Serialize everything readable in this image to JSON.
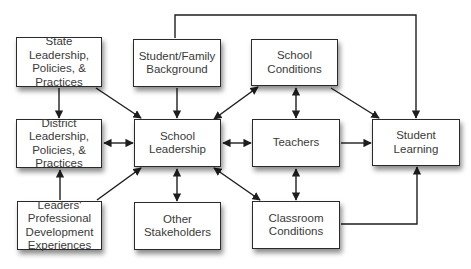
{
  "diagram": {
    "type": "flowchart",
    "title": "",
    "nodes": [
      {
        "id": "state",
        "label": "State\nLeadership,\nPolicies, &\nPractices",
        "x": 16,
        "y": 37,
        "w": 86,
        "h": 50
      },
      {
        "id": "family",
        "label": "Student/Family\nBackground",
        "x": 133,
        "y": 39,
        "w": 88,
        "h": 48
      },
      {
        "id": "school_conditions",
        "label": "School\nConditions",
        "x": 251,
        "y": 39,
        "w": 87,
        "h": 47
      },
      {
        "id": "district",
        "label": "District\nLeadership,\nPolicies, &\nPractices",
        "x": 16,
        "y": 119,
        "w": 86,
        "h": 49
      },
      {
        "id": "school_leadership",
        "label": "School\nLeadership",
        "x": 134,
        "y": 119,
        "w": 87,
        "h": 48
      },
      {
        "id": "teachers",
        "label": "Teachers",
        "x": 252,
        "y": 119,
        "w": 88,
        "h": 48
      },
      {
        "id": "student_learning",
        "label": "Student Learning",
        "x": 372,
        "y": 119,
        "w": 88,
        "h": 47
      },
      {
        "id": "leaders_pd",
        "label": "Leaders'\nProfessional\nDevelopment\nExperiences",
        "x": 17,
        "y": 201,
        "w": 85,
        "h": 49
      },
      {
        "id": "other_stakeholders",
        "label": "Other\nStakeholders",
        "x": 134,
        "y": 202,
        "w": 87,
        "h": 48
      },
      {
        "id": "classroom_conditions",
        "label": "Classroom\nConditions",
        "x": 252,
        "y": 201,
        "w": 88,
        "h": 48
      }
    ],
    "edges": [
      {
        "from": "state",
        "to": "district",
        "direction": "forward"
      },
      {
        "from": "state",
        "to": "school_leadership",
        "direction": "forward"
      },
      {
        "from": "family",
        "to": "school_leadership",
        "direction": "forward"
      },
      {
        "from": "family",
        "to": "student_learning",
        "direction": "forward",
        "routing": "over-top"
      },
      {
        "from": "school_leadership",
        "to": "school_conditions",
        "direction": "both"
      },
      {
        "from": "school_conditions",
        "to": "teachers",
        "direction": "both"
      },
      {
        "from": "school_conditions",
        "to": "student_learning",
        "direction": "forward"
      },
      {
        "from": "district",
        "to": "school_leadership",
        "direction": "both"
      },
      {
        "from": "school_leadership",
        "to": "teachers",
        "direction": "both"
      },
      {
        "from": "teachers",
        "to": "student_learning",
        "direction": "forward"
      },
      {
        "from": "leaders_pd",
        "to": "district",
        "direction": "forward"
      },
      {
        "from": "leaders_pd",
        "to": "school_leadership",
        "direction": "forward"
      },
      {
        "from": "school_leadership",
        "to": "other_stakeholders",
        "direction": "both"
      },
      {
        "from": "school_leadership",
        "to": "classroom_conditions",
        "direction": "both"
      },
      {
        "from": "teachers",
        "to": "classroom_conditions",
        "direction": "both"
      },
      {
        "from": "classroom_conditions",
        "to": "student_learning",
        "direction": "forward",
        "routing": "elbow-right-up"
      }
    ],
    "colors": {
      "line": "#1e1e1e",
      "box_border": "#2a2a2a",
      "text": "#3a3a3a",
      "background": "#ffffff"
    }
  }
}
